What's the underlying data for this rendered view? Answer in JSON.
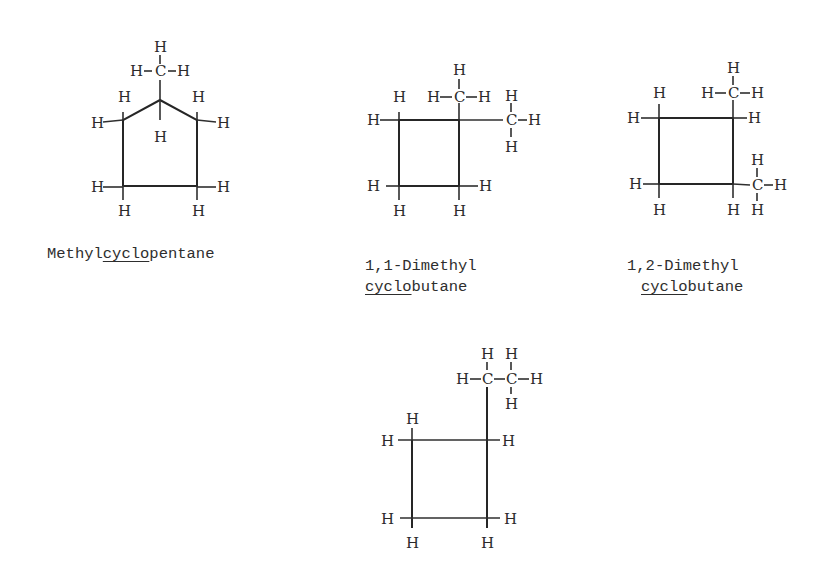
{
  "figure": {
    "type": "chemical-structure-diagrams",
    "atom_symbols": {
      "hydrogen": "H",
      "carbon": "C",
      "bond": "–"
    },
    "colors": {
      "ink": "#2a2a2a",
      "background": "#ffffff"
    }
  },
  "structures": [
    {
      "name": "Methylcyclopentane",
      "caption": {
        "prefix": "Methyl",
        "underlined": "cyclo",
        "suffix": "pentane"
      },
      "formula_note": "5-membered ring with one CH3 substituent"
    },
    {
      "name": "1,1-Dimethyl cyclobutane",
      "caption": {
        "line1": "1,1-Dimethyl",
        "underlined": "cyclo",
        "suffix": "butane"
      },
      "formula_note": "4-membered ring, two CH3 on same carbon"
    },
    {
      "name": "1,2-Dimethyl cyclobutane",
      "caption": {
        "line1": "1,2-Dimethyl",
        "underlined": "cyclo",
        "suffix": "butane"
      },
      "formula_note": "4-membered ring, CH3 on adjacent carbons"
    },
    {
      "name": "Ethylcyclobutane",
      "caption": null,
      "formula_note": "4-membered ring with C2H5 substituent"
    }
  ]
}
